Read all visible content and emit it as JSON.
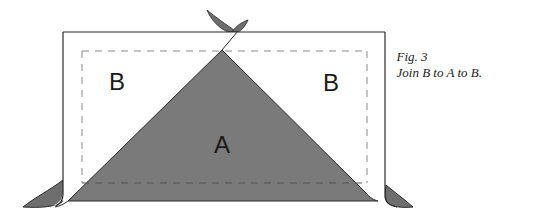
{
  "figure": {
    "number_label": "Fig. 3",
    "caption": "Join B to A to B."
  },
  "pieces": {
    "left_label": "B",
    "center_label": "A",
    "right_label": "B"
  },
  "colors": {
    "triangle_fill": "#7a7a7a",
    "ear_fill": "#6e6e6e",
    "outline": "#2a2a2a",
    "seam_dash": "#888888",
    "background": "#ffffff"
  }
}
